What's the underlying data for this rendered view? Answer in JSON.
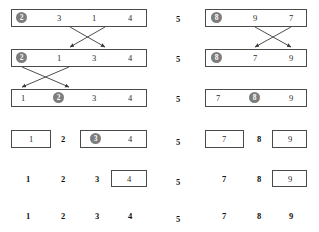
{
  "figure": {
    "title": "",
    "separator_value": "5",
    "separator_rows": [
      "5",
      "5",
      "5",
      "5",
      "5",
      "5"
    ],
    "colors": {
      "highlight_circle": "#7d7d7d",
      "circle_text": "#ffffff",
      "box_border": "#4a4a4a",
      "arrow": "#3a3a3a",
      "text": "#2b2b2b",
      "background": "#ffffff"
    },
    "left_group": {
      "rows": [
        {
          "row": 1,
          "boxed": "whole",
          "cells": [
            {
              "value": "2",
              "highlight": true
            },
            {
              "value": "3",
              "highlight": false
            },
            {
              "value": "1",
              "highlight": false
            },
            {
              "value": "4",
              "highlight": false
            }
          ]
        },
        {
          "row": 2,
          "boxed": "whole",
          "cells": [
            {
              "value": "2",
              "highlight": true
            },
            {
              "value": "1",
              "highlight": false
            },
            {
              "value": "3",
              "highlight": false
            },
            {
              "value": "4",
              "highlight": false
            }
          ]
        },
        {
          "row": 3,
          "boxed": "whole",
          "cells": [
            {
              "value": "1",
              "highlight": false
            },
            {
              "value": "2",
              "highlight": true
            },
            {
              "value": "3",
              "highlight": false
            },
            {
              "value": "4",
              "highlight": false
            }
          ]
        },
        {
          "row": 4,
          "boxed": "partial",
          "cells": [
            {
              "value": "1",
              "highlight": false,
              "boxed": true
            },
            {
              "value": "2",
              "highlight": false,
              "boxed": false,
              "bold": true
            },
            {
              "value": "3",
              "highlight": true,
              "boxed": true
            },
            {
              "value": "4",
              "highlight": false,
              "boxed": true
            }
          ]
        },
        {
          "row": 5,
          "boxed": "partial",
          "cells": [
            {
              "value": "1",
              "highlight": false,
              "boxed": false,
              "bold": true
            },
            {
              "value": "2",
              "highlight": false,
              "boxed": false,
              "bold": true
            },
            {
              "value": "3",
              "highlight": false,
              "boxed": false,
              "bold": true
            },
            {
              "value": "4",
              "highlight": false,
              "boxed": true
            }
          ]
        },
        {
          "row": 6,
          "boxed": "none",
          "cells": [
            {
              "value": "1",
              "highlight": false,
              "bold": true
            },
            {
              "value": "2",
              "highlight": false,
              "bold": true
            },
            {
              "value": "3",
              "highlight": false,
              "bold": true
            },
            {
              "value": "4",
              "highlight": false,
              "bold": true
            }
          ]
        }
      ]
    },
    "right_group": {
      "rows": [
        {
          "row": 1,
          "boxed": "whole",
          "cells": [
            {
              "value": "8",
              "highlight": true
            },
            {
              "value": "9",
              "highlight": false
            },
            {
              "value": "7",
              "highlight": false
            }
          ]
        },
        {
          "row": 2,
          "boxed": "whole",
          "cells": [
            {
              "value": "8",
              "highlight": true
            },
            {
              "value": "7",
              "highlight": false
            },
            {
              "value": "9",
              "highlight": false
            }
          ]
        },
        {
          "row": 3,
          "boxed": "whole",
          "cells": [
            {
              "value": "7",
              "highlight": false
            },
            {
              "value": "8",
              "highlight": true
            },
            {
              "value": "9",
              "highlight": false
            }
          ]
        },
        {
          "row": 4,
          "boxed": "partial",
          "cells": [
            {
              "value": "7",
              "highlight": false,
              "boxed": true
            },
            {
              "value": "8",
              "highlight": false,
              "boxed": false,
              "bold": true
            },
            {
              "value": "9",
              "highlight": false,
              "boxed": true
            }
          ]
        },
        {
          "row": 5,
          "boxed": "partial",
          "cells": [
            {
              "value": "7",
              "highlight": false,
              "boxed": false,
              "bold": true
            },
            {
              "value": "8",
              "highlight": false,
              "boxed": false,
              "bold": true
            },
            {
              "value": "9",
              "highlight": false,
              "boxed": true
            }
          ]
        },
        {
          "row": 6,
          "boxed": "none",
          "cells": [
            {
              "value": "7",
              "highlight": false,
              "bold": true
            },
            {
              "value": "8",
              "highlight": false,
              "bold": true
            },
            {
              "value": "9",
              "highlight": false,
              "bold": true
            }
          ]
        }
      ]
    },
    "swap_arrows": [
      {
        "group": "left",
        "from_row": 1,
        "to_row": 2,
        "from_index": 2,
        "to_index": 3
      },
      {
        "group": "left",
        "from_row": 1,
        "to_row": 2,
        "from_index": 3,
        "to_index": 2
      },
      {
        "group": "left",
        "from_row": 2,
        "to_row": 3,
        "from_index": 1,
        "to_index": 2
      },
      {
        "group": "left",
        "from_row": 2,
        "to_row": 3,
        "from_index": 2,
        "to_index": 1
      },
      {
        "group": "right",
        "from_row": 1,
        "to_row": 2,
        "from_index": 2,
        "to_index": 3
      },
      {
        "group": "right",
        "from_row": 1,
        "to_row": 2,
        "from_index": 3,
        "to_index": 2
      }
    ]
  }
}
